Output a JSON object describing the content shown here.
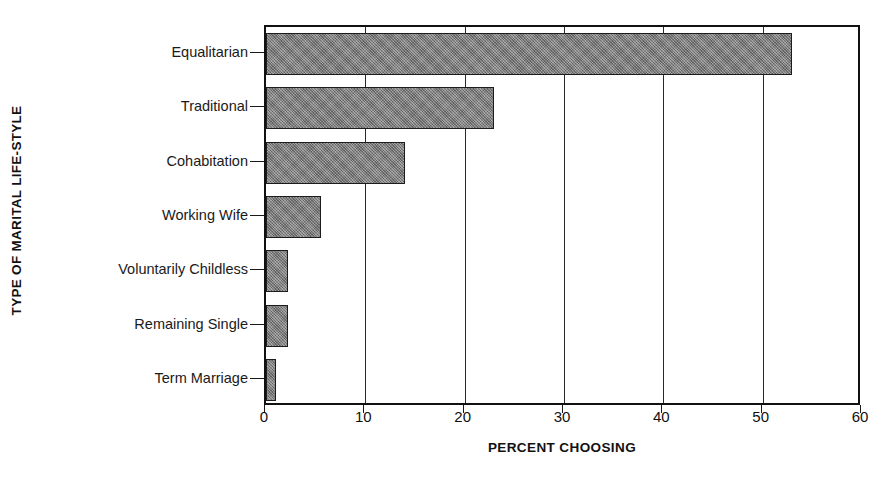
{
  "chart_data": {
    "type": "bar",
    "orientation": "horizontal",
    "title": "",
    "xlabel": "PERCENT CHOOSING",
    "ylabel": "TYPE OF MARITAL LIFE-STYLE",
    "categories": [
      "Equalitarian",
      "Traditional",
      "Cohabitation",
      "Working Wife",
      "Voluntarily Childless",
      "Remaining Single",
      "Term Marriage"
    ],
    "values": [
      53,
      23,
      14,
      5.5,
      2.2,
      2.2,
      1
    ],
    "xlim": [
      0,
      60
    ],
    "xticks": [
      0,
      10,
      20,
      30,
      40,
      50,
      60
    ],
    "xtick_labels": [
      "0",
      "10",
      "20",
      "30",
      "40",
      "50",
      "60"
    ],
    "grid": "vertical",
    "legend": "none",
    "bar_color": "#808080",
    "bar_border_color": "#1c1c1c",
    "axis_color": "#111111",
    "background_color": "#ffffff"
  }
}
